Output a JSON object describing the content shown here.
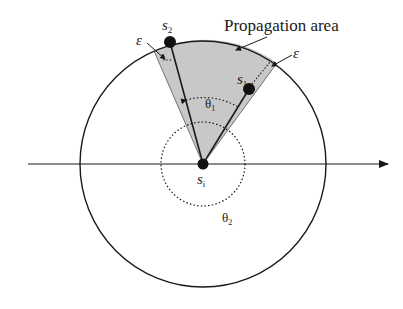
{
  "diagram": {
    "title_label": "Propagation area",
    "nodes": {
      "center": {
        "label": "s",
        "sub": "i"
      },
      "s1": {
        "label": "s",
        "sub": "1"
      },
      "s2": {
        "label": "s",
        "sub": "2"
      }
    },
    "angles": {
      "theta1": {
        "label": "θ",
        "sub": "1"
      },
      "theta2": {
        "label": "θ",
        "sub": "2"
      }
    },
    "epsilon_left": "ε",
    "epsilon_right": "ε",
    "colors": {
      "sector_fill": "#c8c8c8",
      "stroke": "#1a1a1a",
      "background": "#ffffff"
    }
  }
}
